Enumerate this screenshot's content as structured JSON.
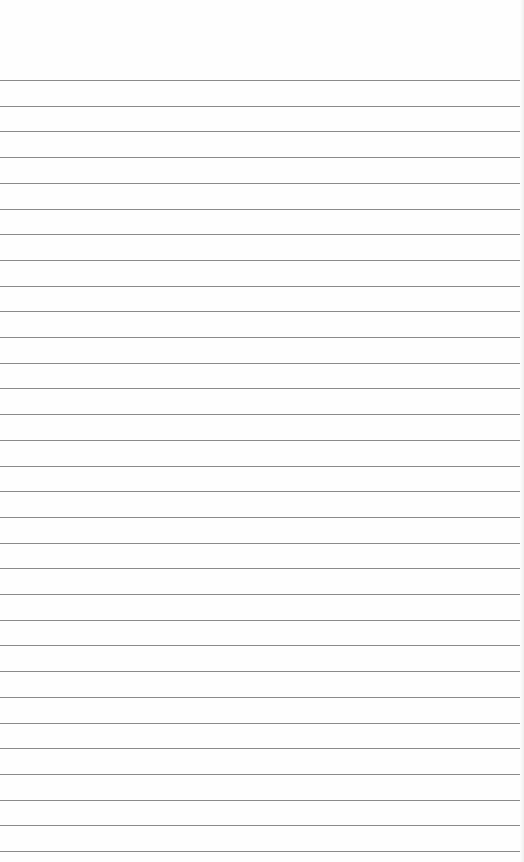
{
  "page": {
    "background_color": "#fefefe",
    "line_color": "#8a8a8a",
    "first_line_y": 80,
    "line_spacing": 25.7,
    "line_count": 31
  }
}
